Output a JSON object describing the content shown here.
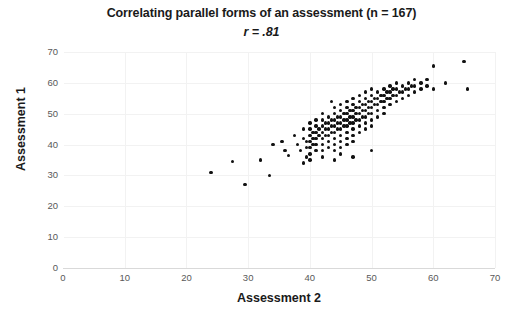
{
  "chart_data": {
    "type": "scatter",
    "title": "Correlating parallel forms of an assessment (n = 167)",
    "subtitle": "r = .81",
    "n": 167,
    "r": 0.81,
    "xlabel": "Assessment 2",
    "ylabel": "Assessment 1",
    "xlim": [
      0,
      70
    ],
    "ylim": [
      0,
      70
    ],
    "xticks": [
      0,
      10,
      20,
      30,
      40,
      50,
      60,
      70
    ],
    "yticks": [
      0,
      10,
      20,
      30,
      40,
      50,
      60,
      70
    ],
    "grid": true,
    "legend": "none",
    "marker_color": "#111111",
    "points": [
      [
        24,
        31
      ],
      [
        27.5,
        34.5
      ],
      [
        29.5,
        27
      ],
      [
        32,
        35
      ],
      [
        33.5,
        30
      ],
      [
        34,
        40
      ],
      [
        35.5,
        41
      ],
      [
        36,
        38
      ],
      [
        36.5,
        36.5
      ],
      [
        37.5,
        43
      ],
      [
        38,
        40
      ],
      [
        38.5,
        38
      ],
      [
        39,
        45
      ],
      [
        39,
        42
      ],
      [
        39.5,
        41
      ],
      [
        39.5,
        39
      ],
      [
        39.5,
        36
      ],
      [
        40,
        47
      ],
      [
        40,
        45
      ],
      [
        40,
        43
      ],
      [
        40,
        41
      ],
      [
        40,
        39
      ],
      [
        40,
        37
      ],
      [
        40,
        35
      ],
      [
        40.5,
        44
      ],
      [
        40.5,
        42
      ],
      [
        40.5,
        40
      ],
      [
        41,
        48
      ],
      [
        41,
        46
      ],
      [
        41,
        44
      ],
      [
        41,
        42
      ],
      [
        41,
        40
      ],
      [
        41,
        38
      ],
      [
        41.5,
        45
      ],
      [
        41.5,
        43
      ],
      [
        42,
        50
      ],
      [
        42,
        48
      ],
      [
        42,
        46
      ],
      [
        42,
        44
      ],
      [
        42,
        42
      ],
      [
        42,
        40
      ],
      [
        42,
        38
      ],
      [
        42,
        36
      ],
      [
        42.5,
        47
      ],
      [
        42.5,
        45
      ],
      [
        42.5,
        43
      ],
      [
        43,
        49
      ],
      [
        43,
        47
      ],
      [
        43,
        45
      ],
      [
        43,
        43
      ],
      [
        43,
        41
      ],
      [
        43,
        39
      ],
      [
        43.5,
        48
      ],
      [
        43.5,
        46
      ],
      [
        43.5,
        44
      ],
      [
        44,
        52
      ],
      [
        44,
        50
      ],
      [
        44,
        48
      ],
      [
        44,
        46
      ],
      [
        44,
        44
      ],
      [
        44,
        42
      ],
      [
        44,
        40
      ],
      [
        44,
        38
      ],
      [
        44.5,
        49
      ],
      [
        44.5,
        47
      ],
      [
        44.5,
        45
      ],
      [
        45,
        53
      ],
      [
        45,
        51
      ],
      [
        45,
        49
      ],
      [
        45,
        47
      ],
      [
        45,
        45
      ],
      [
        45,
        43
      ],
      [
        45,
        41
      ],
      [
        45,
        39
      ],
      [
        45,
        37
      ],
      [
        45.5,
        50
      ],
      [
        45.5,
        48
      ],
      [
        45.5,
        46
      ],
      [
        46,
        54
      ],
      [
        46,
        52
      ],
      [
        46,
        50
      ],
      [
        46,
        48
      ],
      [
        46,
        46
      ],
      [
        46,
        44
      ],
      [
        46,
        42
      ],
      [
        46,
        40
      ],
      [
        46.5,
        51
      ],
      [
        46.5,
        49
      ],
      [
        46.5,
        47
      ],
      [
        47,
        55
      ],
      [
        47,
        53
      ],
      [
        47,
        51
      ],
      [
        47,
        49
      ],
      [
        47,
        47
      ],
      [
        47,
        45
      ],
      [
        47,
        43
      ],
      [
        47,
        41
      ],
      [
        47.5,
        52
      ],
      [
        47.5,
        50
      ],
      [
        47.5,
        48
      ],
      [
        48,
        56
      ],
      [
        48,
        54
      ],
      [
        48,
        52
      ],
      [
        48,
        50
      ],
      [
        48,
        48
      ],
      [
        48,
        46
      ],
      [
        48,
        44
      ],
      [
        48.5,
        53
      ],
      [
        48.5,
        51
      ],
      [
        48.5,
        49
      ],
      [
        49,
        57
      ],
      [
        49,
        55
      ],
      [
        49,
        53
      ],
      [
        49,
        51
      ],
      [
        49,
        49
      ],
      [
        49,
        47
      ],
      [
        49,
        45
      ],
      [
        49.5,
        54
      ],
      [
        49.5,
        52
      ],
      [
        49.5,
        50
      ],
      [
        50,
        58
      ],
      [
        50,
        56
      ],
      [
        50,
        54
      ],
      [
        50,
        52
      ],
      [
        50,
        50
      ],
      [
        50,
        48
      ],
      [
        50,
        46
      ],
      [
        50.5,
        55
      ],
      [
        50.5,
        53
      ],
      [
        51,
        57
      ],
      [
        51,
        55
      ],
      [
        51,
        53
      ],
      [
        51,
        51
      ],
      [
        51,
        49
      ],
      [
        51.5,
        56
      ],
      [
        51.5,
        54
      ],
      [
        52,
        58
      ],
      [
        52,
        56
      ],
      [
        52,
        54
      ],
      [
        52,
        52
      ],
      [
        52,
        50
      ],
      [
        52.5,
        57
      ],
      [
        52.5,
        55
      ],
      [
        53,
        59
      ],
      [
        53,
        57
      ],
      [
        53,
        55
      ],
      [
        53,
        53
      ],
      [
        53.5,
        58
      ],
      [
        53.5,
        56
      ],
      [
        54,
        60
      ],
      [
        54,
        58
      ],
      [
        54,
        56
      ],
      [
        54,
        54
      ],
      [
        54.5,
        57
      ],
      [
        55,
        59
      ],
      [
        55,
        57
      ],
      [
        55,
        55
      ],
      [
        55.5,
        58
      ],
      [
        56,
        60
      ],
      [
        56,
        58
      ],
      [
        56,
        56
      ],
      [
        56.5,
        59
      ],
      [
        57,
        61
      ],
      [
        57,
        59
      ],
      [
        57,
        57
      ],
      [
        58,
        60
      ],
      [
        58,
        58
      ],
      [
        59,
        61
      ],
      [
        59,
        59
      ],
      [
        60,
        65.5
      ],
      [
        60,
        58
      ],
      [
        62,
        60
      ],
      [
        65,
        67
      ],
      [
        65.5,
        58
      ],
      [
        50,
        38
      ],
      [
        47,
        36
      ],
      [
        44,
        35
      ],
      [
        43.5,
        54
      ],
      [
        39,
        34
      ]
    ]
  }
}
